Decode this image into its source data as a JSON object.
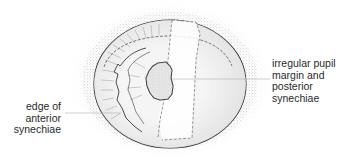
{
  "figure": {
    "colors": {
      "line": "#2b2b2b",
      "stipple": "#9a9a9a",
      "iris_shade": "#e4e4e4",
      "pupil_fill": "#dcdcdc",
      "background": "#ffffff"
    }
  },
  "annotations": {
    "right": {
      "lines": [
        "irregular pupil",
        "margin and",
        "posterior",
        "synechiae"
      ]
    },
    "left": {
      "lines": [
        "edge of",
        "anterior",
        "synechiae"
      ]
    }
  }
}
